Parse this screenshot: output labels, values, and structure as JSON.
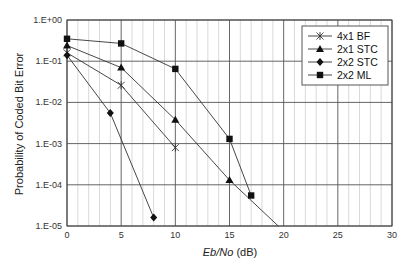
{
  "chart_data": {
    "type": "line",
    "title": "",
    "xlabel_italic": "Eb/No",
    "xlabel_unit": " (dB)",
    "xlabel": "Eb/No (dB)",
    "ylabel": "Probability of Coded Bit Error",
    "xlim": [
      0,
      30
    ],
    "ylim": [
      1e-05,
      1
    ],
    "yscale": "log",
    "x_ticks": [
      "0",
      "5",
      "10",
      "15",
      "20",
      "25",
      "30"
    ],
    "y_ticks": [
      "1.E+00",
      "1.E-01",
      "1.E-02",
      "1.E-03",
      "1.E-04",
      "1.E-05"
    ],
    "grid": true,
    "legend_position": "upper right",
    "series": [
      {
        "name": "4x1 BF",
        "marker": "star",
        "x": [
          0,
          5,
          10
        ],
        "y": [
          0.16,
          0.026,
          0.0008
        ]
      },
      {
        "name": "2x1 STC",
        "marker": "triangle",
        "x": [
          0,
          5,
          10,
          15,
          19.5
        ],
        "y": [
          0.24,
          0.07,
          0.0038,
          0.00013,
          1e-05
        ],
        "marker_mask": [
          1,
          1,
          1,
          1,
          0
        ]
      },
      {
        "name": "2x2 STC",
        "marker": "diamond",
        "x": [
          0,
          4,
          8
        ],
        "y": [
          0.14,
          0.0055,
          1.6e-05
        ]
      },
      {
        "name": "2x2 ML",
        "marker": "square",
        "x": [
          0,
          5,
          10,
          15,
          17
        ],
        "y": [
          0.35,
          0.27,
          0.065,
          0.0013,
          5.5e-05
        ]
      }
    ]
  }
}
